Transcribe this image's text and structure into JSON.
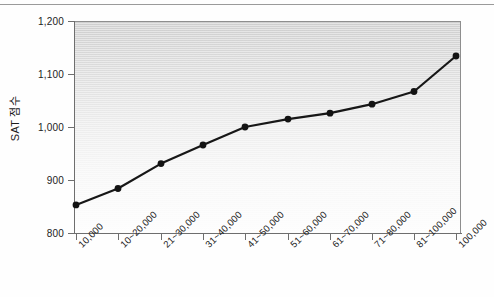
{
  "figure": {
    "background_color": "#fefefe",
    "plot_fill_top": "#cfcfcf",
    "plot_fill_bottom": "#fdfdfd",
    "line_color": "#171717",
    "axis_color": "#6e6e6e"
  },
  "chart_data": {
    "type": "line",
    "title": "",
    "xlabel": "",
    "ylabel": "SAT 점수",
    "ylim": [
      800,
      1200
    ],
    "yticks": [
      "800",
      "900",
      "1,000",
      "1,100",
      "1,200"
    ],
    "ytick_values": [
      800,
      900,
      1000,
      1100,
      1200
    ],
    "grid": false,
    "legend": "none",
    "categories": [
      "10,000",
      "10~20,000",
      "21~30,000",
      "31~40,000",
      "41~50,000",
      "51~60,000",
      "61~70,000",
      "71~80,000",
      "81~100,000",
      "100,000"
    ],
    "values": [
      853,
      884,
      931,
      966,
      1000,
      1015,
      1026,
      1043,
      1067,
      1134
    ],
    "series": [
      {
        "name": "SAT 점수",
        "marker": "circle",
        "values": [
          853,
          884,
          931,
          966,
          1000,
          1015,
          1026,
          1043,
          1067,
          1134
        ]
      }
    ]
  }
}
